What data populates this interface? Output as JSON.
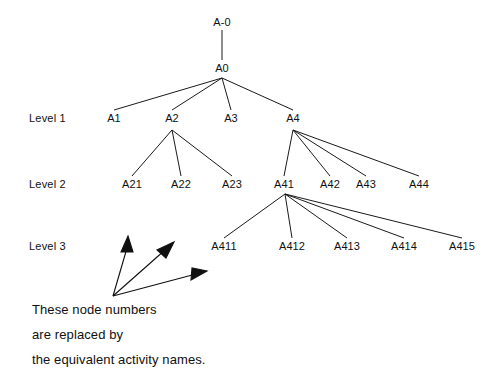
{
  "diagram": {
    "type": "hierarchical-tree",
    "title": "",
    "background_color": "#ffffff",
    "line_color": "#1a1a1a",
    "text_color": "#101010",
    "root": {
      "id": "A-0",
      "label": "A-0",
      "x": 222,
      "y": 22
    },
    "nodes": [
      {
        "id": "A0",
        "label": "A0",
        "x": 222,
        "y": 68,
        "level": "root"
      },
      {
        "id": "A1",
        "label": "A1",
        "x": 114,
        "y": 118,
        "level": "Level 1"
      },
      {
        "id": "A2",
        "label": "A2",
        "x": 172,
        "y": 118,
        "level": "Level 1"
      },
      {
        "id": "A3",
        "label": "A3",
        "x": 231,
        "y": 118,
        "level": "Level 1"
      },
      {
        "id": "A4",
        "label": "A4",
        "x": 293,
        "y": 118,
        "level": "Level 1"
      },
      {
        "id": "A21",
        "label": "A21",
        "x": 132,
        "y": 184,
        "level": "Level 2"
      },
      {
        "id": "A22",
        "label": "A22",
        "x": 181,
        "y": 184,
        "level": "Level 2"
      },
      {
        "id": "A23",
        "label": "A23",
        "x": 232,
        "y": 184,
        "level": "Level 2"
      },
      {
        "id": "A41",
        "label": "A41",
        "x": 284,
        "y": 184,
        "level": "Level 2"
      },
      {
        "id": "A42",
        "label": "A42",
        "x": 330,
        "y": 184,
        "level": "Level 2"
      },
      {
        "id": "A43",
        "label": "A43",
        "x": 366,
        "y": 184,
        "level": "Level 2"
      },
      {
        "id": "A44",
        "label": "A44",
        "x": 419,
        "y": 184,
        "level": "Level 2"
      },
      {
        "id": "A411",
        "label": "A411",
        "x": 224,
        "y": 246,
        "level": "Level 3"
      },
      {
        "id": "A412",
        "label": "A412",
        "x": 292,
        "y": 246,
        "level": "Level 3"
      },
      {
        "id": "A413",
        "label": "A413",
        "x": 347,
        "y": 246,
        "level": "Level 3"
      },
      {
        "id": "A414",
        "label": "A414",
        "x": 404,
        "y": 246,
        "level": "Level 3"
      },
      {
        "id": "A415",
        "label": "A415",
        "x": 462,
        "y": 246,
        "level": "Level 3"
      }
    ],
    "edges": [
      {
        "from": "A-0",
        "to": "A0"
      },
      {
        "from": "A0",
        "to": "A1"
      },
      {
        "from": "A0",
        "to": "A2"
      },
      {
        "from": "A0",
        "to": "A3"
      },
      {
        "from": "A0",
        "to": "A4"
      },
      {
        "from": "A2",
        "to": "A21"
      },
      {
        "from": "A2",
        "to": "A22"
      },
      {
        "from": "A2",
        "to": "A23"
      },
      {
        "from": "A4",
        "to": "A41"
      },
      {
        "from": "A4",
        "to": "A42"
      },
      {
        "from": "A4",
        "to": "A43"
      },
      {
        "from": "A4",
        "to": "A44"
      },
      {
        "from": "A41",
        "to": "A411"
      },
      {
        "from": "A41",
        "to": "A412"
      },
      {
        "from": "A41",
        "to": "A413"
      },
      {
        "from": "A41",
        "to": "A414"
      },
      {
        "from": "A41",
        "to": "A415"
      }
    ],
    "level_labels": [
      {
        "id": "level-1",
        "label": "Level 1",
        "x": 29,
        "y": 118
      },
      {
        "id": "level-2",
        "label": "Level 2",
        "x": 29,
        "y": 184
      },
      {
        "id": "level-3",
        "label": "Level 3",
        "x": 29,
        "y": 246
      }
    ],
    "annotation": {
      "arrow_origin": {
        "x": 113,
        "y": 296
      },
      "arrows": [
        {
          "id": "arrow-up",
          "tip_x": 128,
          "tip_y": 236
        },
        {
          "id": "arrow-upright",
          "tip_x": 172,
          "tip_y": 243
        },
        {
          "id": "arrow-right",
          "tip_x": 205,
          "tip_y": 272
        }
      ],
      "caption_lines": [
        "These node numbers",
        "are replaced by",
        "the equivalent activity names."
      ]
    }
  }
}
